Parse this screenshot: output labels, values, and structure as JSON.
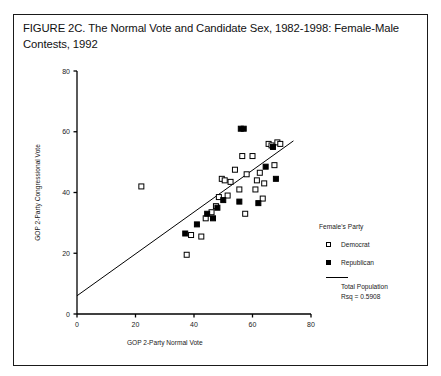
{
  "figure": {
    "title": "FIGURE 2C. The Normal Vote and Candidate Sex, 1982-1998: Female-Male Contests, 1992"
  },
  "legend": {
    "title": "Female's Party",
    "entries": [
      {
        "label": "Democrat",
        "marker": "open-square"
      },
      {
        "label": "Republican",
        "marker": "filled-square"
      }
    ],
    "fit_line_label": "Total Population",
    "fit_rsq_label": "Rsq = 0.5908"
  },
  "chart_data": {
    "type": "scatter",
    "title": "FIGURE 2C. The Normal Vote and Candidate Sex, 1982-1998: Female-Male Contests, 1992",
    "xlabel": "GOP 2-Party Normal Vote",
    "ylabel": "GOP 2-Party Congressional Vote",
    "xlim": [
      0,
      80
    ],
    "ylim": [
      0,
      80
    ],
    "xticks": [
      0,
      20,
      40,
      60,
      80
    ],
    "yticks": [
      0,
      20,
      40,
      60,
      80
    ],
    "grid": false,
    "legend_position": "right",
    "series": [
      {
        "name": "Democrat",
        "marker": "open-square",
        "points": [
          [
            22.0,
            42.0
          ],
          [
            37.5,
            19.5
          ],
          [
            39.0,
            26.0
          ],
          [
            42.5,
            25.5
          ],
          [
            44.0,
            31.5
          ],
          [
            46.0,
            33.5
          ],
          [
            47.5,
            35.5
          ],
          [
            48.5,
            38.5
          ],
          [
            49.5,
            44.5
          ],
          [
            50.5,
            44.0
          ],
          [
            51.5,
            39.0
          ],
          [
            52.5,
            43.5
          ],
          [
            54.0,
            47.5
          ],
          [
            55.5,
            41.0
          ],
          [
            56.5,
            52.0
          ],
          [
            57.5,
            33.0
          ],
          [
            58.0,
            46.0
          ],
          [
            60.0,
            52.0
          ],
          [
            61.0,
            41.0
          ],
          [
            61.5,
            44.0
          ],
          [
            62.5,
            46.5
          ],
          [
            63.5,
            38.0
          ],
          [
            64.0,
            43.0
          ],
          [
            65.5,
            56.0
          ],
          [
            66.5,
            55.5
          ],
          [
            67.5,
            49.0
          ],
          [
            68.5,
            56.5
          ],
          [
            69.5,
            56.0
          ]
        ]
      },
      {
        "name": "Republican",
        "marker": "filled-square",
        "points": [
          [
            37.0,
            26.5
          ],
          [
            41.0,
            29.5
          ],
          [
            44.5,
            33.0
          ],
          [
            46.5,
            31.5
          ],
          [
            48.0,
            35.0
          ],
          [
            50.0,
            37.5
          ],
          [
            55.5,
            37.0
          ],
          [
            56.0,
            61.0
          ],
          [
            57.0,
            61.0
          ],
          [
            62.0,
            36.5
          ],
          [
            64.5,
            48.5
          ],
          [
            67.0,
            55.0
          ],
          [
            68.0,
            44.5
          ]
        ]
      }
    ],
    "fit_line": {
      "label": "Total Population",
      "rsq": 0.5908,
      "x_start": 0.0,
      "y_start": 6.0,
      "x_end": 74.0,
      "y_end": 57.0
    }
  }
}
